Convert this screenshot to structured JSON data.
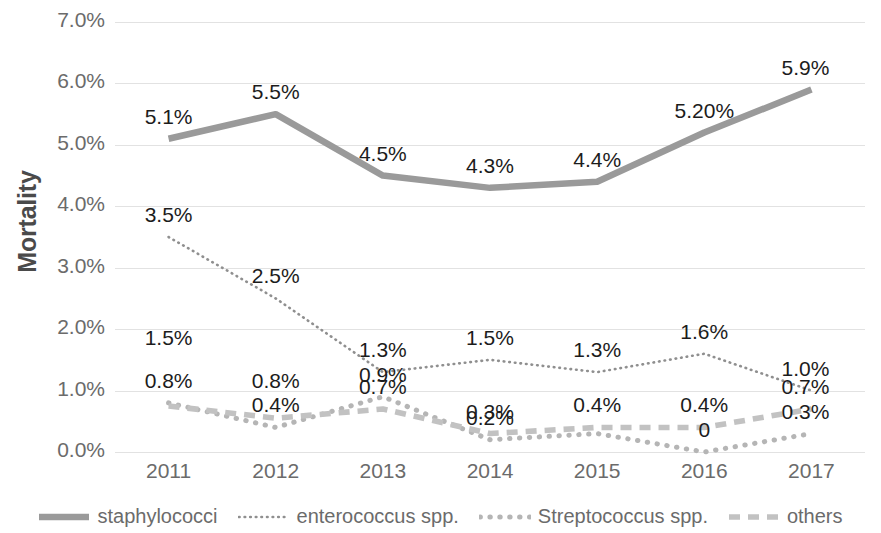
{
  "chart_data": {
    "type": "line",
    "title": "",
    "xlabel": "",
    "ylabel": "Mortality",
    "categories": [
      "2011",
      "2012",
      "2013",
      "2014",
      "2015",
      "2016",
      "2017"
    ],
    "x": [
      2011,
      2012,
      2013,
      2014,
      2015,
      2016,
      2017
    ],
    "ylim": [
      0,
      7
    ],
    "ytick_labels": [
      "0.0%",
      "1.0%",
      "2.0%",
      "3.0%",
      "4.0%",
      "5.0%",
      "6.0%",
      "7.0%"
    ],
    "ytick_values": [
      0,
      1,
      2,
      3,
      4,
      5,
      6,
      7
    ],
    "grid": true,
    "legend_position": "bottom",
    "series": [
      {
        "name": "staphylococci",
        "style": "solid",
        "color": "#9a9a9a",
        "values": [
          5.1,
          5.5,
          4.5,
          4.3,
          4.4,
          5.2,
          5.9
        ],
        "labels": [
          "5.1%",
          "5.5%",
          "4.5%",
          "4.3%",
          "4.4%",
          "5.20%",
          "5.9%"
        ]
      },
      {
        "name": "enterococcus spp.",
        "style": "fine-dotted",
        "color": "#8f8f8f",
        "values": [
          3.5,
          2.5,
          1.3,
          1.5,
          1.3,
          1.6,
          1.0
        ],
        "labels": [
          "3.5%",
          "2.5%",
          "1.3%",
          "1.5%",
          "1.3%",
          "1.6%",
          "1.0%"
        ]
      },
      {
        "name": "Streptococcus spp.",
        "style": "dotted",
        "color": "#b5b5b5",
        "values": [
          0.8,
          0.4,
          0.9,
          0.2,
          0.3,
          0.0,
          0.3
        ],
        "labels": [
          "0.8%",
          "0.4%",
          "0.9%",
          "0.2%",
          "",
          "0",
          "0.3%"
        ]
      },
      {
        "name": "others",
        "style": "dashed",
        "color": "#c2c2c2",
        "values": [
          0.75,
          0.55,
          0.7,
          0.3,
          0.4,
          0.4,
          0.7
        ],
        "labels": [
          "1.5%",
          "0.8%",
          "0.7%",
          "0.3%",
          "0.4%",
          "0.4%",
          "0.7%"
        ]
      }
    ],
    "data_labels": [
      {
        "text": "5.1%",
        "x": 2011,
        "y": 5.1,
        "dx": 0,
        "dy": -34
      },
      {
        "text": "5.5%",
        "x": 2012,
        "y": 5.5,
        "dx": 0,
        "dy": -34
      },
      {
        "text": "4.5%",
        "x": 2013,
        "y": 4.5,
        "dx": 0,
        "dy": -34
      },
      {
        "text": "4.3%",
        "x": 2014,
        "y": 4.3,
        "dx": 0,
        "dy": -34
      },
      {
        "text": "4.4%",
        "x": 2015,
        "y": 4.4,
        "dx": 0,
        "dy": -34
      },
      {
        "text": "5.20%",
        "x": 2016,
        "y": 5.2,
        "dx": 0,
        "dy": -34
      },
      {
        "text": "5.9%",
        "x": 2017,
        "y": 5.9,
        "dx": -6,
        "dy": -34
      },
      {
        "text": "3.5%",
        "x": 2011,
        "y": 3.5,
        "dx": 0,
        "dy": -34
      },
      {
        "text": "2.5%",
        "x": 2012,
        "y": 2.5,
        "dx": 0,
        "dy": -34
      },
      {
        "text": "1.3%",
        "x": 2013,
        "y": 1.3,
        "dx": 0,
        "dy": -34
      },
      {
        "text": "1.5%",
        "x": 2014,
        "y": 1.5,
        "dx": 0,
        "dy": -34
      },
      {
        "text": "1.3%",
        "x": 2015,
        "y": 1.3,
        "dx": 0,
        "dy": -34
      },
      {
        "text": "1.6%",
        "x": 2016,
        "y": 1.6,
        "dx": 0,
        "dy": -34
      },
      {
        "text": "1.0%",
        "x": 2017,
        "y": 1.0,
        "dx": -6,
        "dy": -34
      },
      {
        "text": "1.5%",
        "x": 2011,
        "y": 1.5,
        "dx": 0,
        "dy": -34
      },
      {
        "text": "0.8%",
        "x": 2011,
        "y": 0.8,
        "dx": 0,
        "dy": -34
      },
      {
        "text": "0.8%",
        "x": 2012,
        "y": 0.8,
        "dx": 0,
        "dy": -34
      },
      {
        "text": "0.4%",
        "x": 2012,
        "y": 0.4,
        "dx": 0,
        "dy": -34
      },
      {
        "text": "0.9%",
        "x": 2013,
        "y": 0.9,
        "dx": 0,
        "dy": -34
      },
      {
        "text": "0.7%",
        "x": 2013,
        "y": 0.7,
        "dx": 0,
        "dy": -34
      },
      {
        "text": "0.3%",
        "x": 2014,
        "y": 0.3,
        "dx": 0,
        "dy": -34
      },
      {
        "text": "0.2%",
        "x": 2014,
        "y": 0.2,
        "dx": 0,
        "dy": -34
      },
      {
        "text": "0.4%",
        "x": 2015,
        "y": 0.4,
        "dx": 0,
        "dy": -34
      },
      {
        "text": "0.4%",
        "x": 2016,
        "y": 0.4,
        "dx": 0,
        "dy": -34
      },
      {
        "text": "0",
        "x": 2016,
        "y": 0.0,
        "dx": 0,
        "dy": -34
      },
      {
        "text": "0.7%",
        "x": 2017,
        "y": 0.7,
        "dx": -6,
        "dy": -34
      },
      {
        "text": "0.3%",
        "x": 2017,
        "y": 0.3,
        "dx": -6,
        "dy": -34
      }
    ]
  },
  "legend": {
    "items": [
      {
        "label": "staphylococci",
        "mark": "solid-line-marker"
      },
      {
        "label": "enterococcus spp.",
        "mark": "fine-dotted-line-marker"
      },
      {
        "label": "Streptococcus spp.",
        "mark": "dotted-line-marker"
      },
      {
        "label": "others",
        "mark": "dashed-line-marker"
      }
    ]
  }
}
